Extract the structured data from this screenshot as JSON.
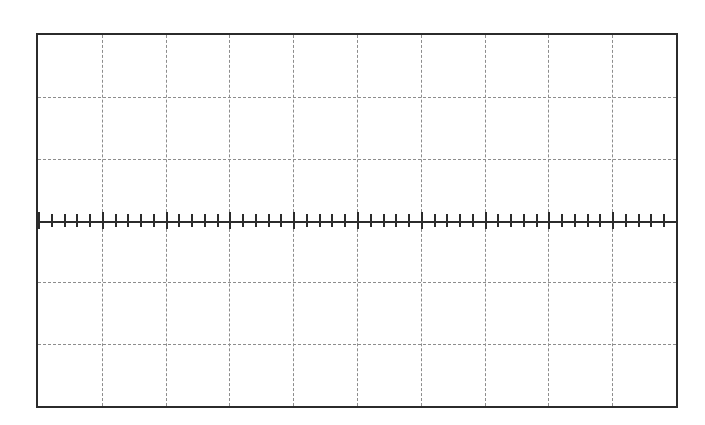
{
  "figure": {
    "kind": "oscilloscope-graticule",
    "title": "",
    "background_color": "#ffffff",
    "border_color": "#2b2b2b",
    "gridline_color": "#8d8d8d",
    "axis_color": "#2b2b2b",
    "border_width_px": 2,
    "frame": {
      "left_px": 36,
      "top_px": 33,
      "width_px": 642,
      "height_px": 375
    }
  },
  "chart_data": {
    "type": "line",
    "title": "",
    "subtitle": "",
    "xlabel": "",
    "ylabel": "",
    "grid": true,
    "grid_style": "dashed",
    "legend": null,
    "legend_position": "none",
    "annotations": [],
    "series": [],
    "x": [],
    "categories": [],
    "values": [],
    "divisions": {
      "horizontal": 10,
      "vertical": 6,
      "minor_ticks_per_division": 5
    },
    "xlim": [
      -5,
      5
    ],
    "ylim": [
      -3,
      3
    ],
    "xticks": [
      -5,
      -4,
      -3,
      -2,
      -1,
      0,
      1,
      2,
      3,
      4,
      5
    ],
    "yticks": [
      -3,
      -2,
      -1,
      0,
      1,
      2,
      3
    ],
    "xticklabels": [
      "",
      "",
      "",
      "",
      "",
      "",
      "",
      "",
      "",
      "",
      ""
    ],
    "yticklabels": [
      "",
      "",
      "",
      "",
      "",
      "",
      ""
    ],
    "axis_row": {
      "position": "center",
      "y_division": 0,
      "tick_count": 51,
      "tick_direction": "both"
    }
  }
}
